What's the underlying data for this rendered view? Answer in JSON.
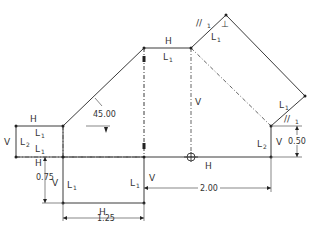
{
  "constraints": {
    "h": "H",
    "v": "V",
    "l1": "L",
    "l2": "L",
    "sub1": "1",
    "sub2": "2",
    "parallel": "//",
    "perp": "⊥"
  },
  "dimensions": {
    "angle": "45.00",
    "vert_left": "0.75",
    "horiz_bottom": "1.25",
    "horiz_long": "2.00",
    "vert_right": "0.50"
  }
}
